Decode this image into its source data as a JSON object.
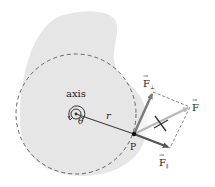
{
  "diagram": {
    "type": "torque-force-decomposition",
    "labels": {
      "axis": "axis",
      "angle": "θ",
      "radius": "r",
      "point": "P",
      "force": "F",
      "force_perp": "F",
      "force_perp_sub": "⊥",
      "force_par": "F",
      "force_par_sub": "∥",
      "vector_arrow": "→"
    },
    "colors": {
      "body_fill": "#e6e6e6",
      "dashed_circle": "#666666",
      "radius_line": "#444444",
      "force_perp": "#7a7a7a",
      "force_par": "#555555",
      "force_total": "#b8b8b8",
      "parallelogram": "#777777",
      "text": "#222222"
    }
  }
}
